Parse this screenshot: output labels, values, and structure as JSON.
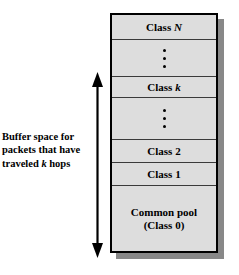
{
  "figure": {
    "name": "buffer-class-allocation-diagram",
    "caption": {
      "lines": [
        "Buffer space for",
        "packets that have",
        "traveled k hops"
      ],
      "emphasis_symbol": "k"
    },
    "arrow": {
      "name": "double-headed-vertical-arrow",
      "direction": "both",
      "meaning": "extent of buffer space spanned by classes"
    },
    "stack": {
      "fill_color": "#dddddd",
      "border_color": "#000000",
      "shadow_color": "#888888",
      "cells": [
        {
          "id": "class-n",
          "type": "label",
          "label": "Class N",
          "italic_part": "N"
        },
        {
          "id": "dots-1",
          "type": "dots",
          "label": "",
          "dot_count": 3
        },
        {
          "id": "class-k",
          "type": "label",
          "label": "Class k",
          "italic_part": "k"
        },
        {
          "id": "dots-2",
          "type": "dots",
          "label": "",
          "dot_count": 3
        },
        {
          "id": "class-2",
          "type": "label",
          "label": "Class 2",
          "italic_part": ""
        },
        {
          "id": "class-1",
          "type": "label",
          "label": "Class 1",
          "italic_part": ""
        },
        {
          "id": "common-pool",
          "type": "pool",
          "label": "Common pool",
          "sublabel": "(Class 0)"
        }
      ]
    }
  }
}
